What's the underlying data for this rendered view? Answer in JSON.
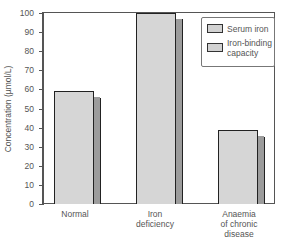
{
  "chart_data": {
    "type": "bar",
    "title": "",
    "xlabel": "",
    "ylabel": "Concentration (µmol/L)",
    "ylim": [
      0,
      100
    ],
    "yticks": [
      0,
      10,
      20,
      30,
      40,
      50,
      60,
      70,
      80,
      90,
      100
    ],
    "grid": false,
    "legend_position": "upper right",
    "categories": [
      "Normal",
      "Iron deficiency",
      "Anaemia of chronic disease"
    ],
    "category_label_lines": [
      [
        "Normal"
      ],
      [
        "Iron",
        "deficiency"
      ],
      [
        "Anaemia",
        "of chronic",
        "disease"
      ]
    ],
    "series": [
      {
        "name": "Total iron-binding capacity",
        "values": [
          59,
          100,
          39
        ]
      }
    ],
    "legend": [
      "Serum iron",
      "Iron-binding capacity"
    ],
    "legend_lines": [
      [
        "Serum iron"
      ],
      [
        "Iron-binding",
        "capacity"
      ]
    ],
    "style": {
      "bar_color": "#d6d6d6",
      "bar_side_color": "#9c9c9c",
      "edge_color": "#222222",
      "bars_3d": true
    }
  }
}
